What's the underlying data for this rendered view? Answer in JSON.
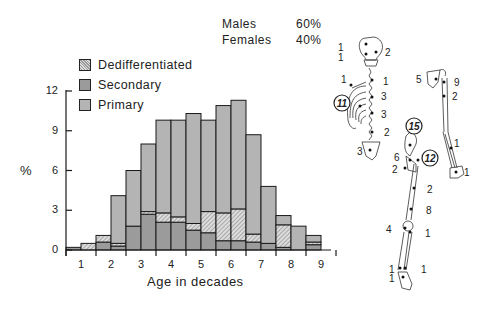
{
  "chart_data": {
    "type": "bar",
    "stacked": true,
    "title": "",
    "xlabel": "Age in decades",
    "ylabel": "%",
    "ylim": [
      0,
      12
    ],
    "yticks": [
      0,
      3,
      6,
      9,
      12
    ],
    "xticks": [
      "1",
      "2",
      "3",
      "4",
      "5",
      "6",
      "7",
      "8",
      "9"
    ],
    "bin_width_decades": 0.5,
    "bins": [
      "0.5-1",
      "1-1.5",
      "1.5-2",
      "2-2.5",
      "2.5-3",
      "3-3.5",
      "3.5-4",
      "4-4.5",
      "4.5-5",
      "5-5.5",
      "5.5-6",
      "6-6.5",
      "6.5-7",
      "7-7.5",
      "7.5-8",
      "8-8.5",
      "8.5-9"
    ],
    "totals": [
      0.2,
      0.5,
      1.1,
      4.1,
      6.0,
      8.0,
      9.8,
      9.8,
      10.3,
      9.8,
      10.9,
      11.3,
      8.7,
      4.8,
      2.6,
      1.8,
      1.1
    ],
    "series": [
      {
        "name": "Secondary",
        "values": [
          0.2,
          0.0,
          0.6,
          0.3,
          1.8,
          2.7,
          2.1,
          2.1,
          1.5,
          1.3,
          0.7,
          0.7,
          0.6,
          0.5,
          0.2,
          0.0,
          0.4
        ]
      },
      {
        "name": "Dedifferentiated",
        "values": [
          0.0,
          0.5,
          0.5,
          0.2,
          0.0,
          0.2,
          0.7,
          0.4,
          0.5,
          1.6,
          2.1,
          2.4,
          0.6,
          0.0,
          1.7,
          0.0,
          0.2
        ]
      },
      {
        "name": "Primary",
        "values": [
          0.0,
          0.0,
          0.0,
          3.6,
          4.2,
          5.1,
          7.0,
          7.3,
          8.3,
          6.9,
          8.1,
          8.2,
          7.5,
          4.3,
          0.7,
          1.8,
          0.5
        ]
      }
    ],
    "legend": [
      "Dedifferentiated",
      "Secondary",
      "Primary"
    ],
    "legend_position": "top-left",
    "grid": false,
    "annotations": [
      {
        "label": "Males",
        "value": "60%"
      },
      {
        "label": "Females",
        "value": "40%"
      }
    ]
  },
  "header": {
    "males_label": "Males",
    "males_value": "60%",
    "females_label": "Females",
    "females_value": "40%"
  },
  "legend": {
    "dediff": "Dedifferentiated",
    "secondary": "Secondary",
    "primary": "Primary"
  },
  "axis": {
    "ylabel": "%",
    "xlabel": "Age in decades",
    "yticks": [
      "0",
      "3",
      "6",
      "9",
      "12"
    ],
    "xticks": [
      "1",
      "2",
      "3",
      "4",
      "5",
      "6",
      "7",
      "8",
      "9"
    ]
  },
  "skeleton": {
    "labels": [
      {
        "text": "1",
        "x": 338,
        "y": 47
      },
      {
        "text": "2",
        "x": 385,
        "y": 52
      },
      {
        "text": "1",
        "x": 338,
        "y": 57
      },
      {
        "text": "1",
        "x": 341,
        "y": 79
      },
      {
        "text": "1",
        "x": 383,
        "y": 81
      },
      {
        "text": "3",
        "x": 381,
        "y": 96
      },
      {
        "text": "3",
        "x": 381,
        "y": 114
      },
      {
        "text": "2",
        "x": 384,
        "y": 132
      },
      {
        "text": "3",
        "x": 357,
        "y": 151
      },
      {
        "text": "5",
        "x": 416,
        "y": 79
      },
      {
        "text": "9",
        "x": 454,
        "y": 82
      },
      {
        "text": "2",
        "x": 452,
        "y": 96
      },
      {
        "text": "1",
        "x": 454,
        "y": 143
      },
      {
        "text": "1",
        "x": 464,
        "y": 172
      },
      {
        "text": "6",
        "x": 394,
        "y": 157
      },
      {
        "text": "2",
        "x": 392,
        "y": 169
      },
      {
        "text": "2",
        "x": 427,
        "y": 189
      },
      {
        "text": "8",
        "x": 426,
        "y": 210
      },
      {
        "text": "4",
        "x": 386,
        "y": 229
      },
      {
        "text": "1",
        "x": 425,
        "y": 233
      },
      {
        "text": "1",
        "x": 389,
        "y": 269
      },
      {
        "text": "1",
        "x": 421,
        "y": 269
      },
      {
        "text": "1",
        "x": 389,
        "y": 278
      }
    ],
    "circled": [
      {
        "text": "11",
        "x": 342,
        "y": 103
      },
      {
        "text": "15",
        "x": 414,
        "y": 126
      },
      {
        "text": "12",
        "x": 430,
        "y": 158
      }
    ]
  }
}
